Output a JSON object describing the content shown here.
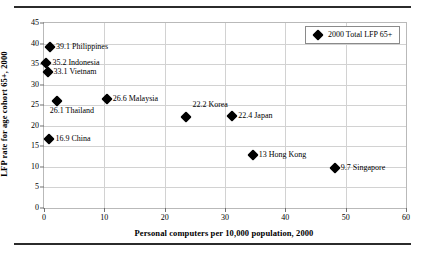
{
  "chart_data": {
    "type": "scatter",
    "title": "",
    "xlabel": "Personal  computers  per 10,000 population,  2000",
    "ylabel": "LFP rate for age cohort 65+, 2000",
    "xlim": [
      0,
      60
    ],
    "ylim": [
      0,
      45
    ],
    "xticks": [
      0,
      10,
      20,
      30,
      40,
      50,
      60
    ],
    "yticks": [
      0,
      5,
      10,
      15,
      20,
      25,
      30,
      35,
      40,
      45
    ],
    "grid": true,
    "legend": {
      "position": "top-right",
      "entries": [
        {
          "label": "2000 Total LFP 65+",
          "marker": "diamond",
          "color": "#000000"
        }
      ]
    },
    "series": [
      {
        "name": "2000 Total LFP 65+",
        "marker": "diamond",
        "color": "#000000",
        "points": [
          {
            "label": "39.1 Philippines",
            "country": "Philippines",
            "x": 1.0,
            "y": 39.1,
            "label_pos": "right"
          },
          {
            "label": "35.2 Indonesia",
            "country": "Indonesia",
            "x": 0.4,
            "y": 35.2,
            "label_pos": "right"
          },
          {
            "label": "33.1 Vietnam",
            "country": "Vietnam",
            "x": 0.6,
            "y": 33.1,
            "label_pos": "right"
          },
          {
            "label": "26.6 Malaysia",
            "country": "Malaysia",
            "x": 10.4,
            "y": 26.6,
            "label_pos": "right"
          },
          {
            "label": "26.1 Thailand",
            "country": "Thailand",
            "x": 2.1,
            "y": 26.1,
            "label_pos": "below-left"
          },
          {
            "label": "22.2 Korea",
            "country": "Korea",
            "x": 23.6,
            "y": 22.2,
            "label_pos": "above-left"
          },
          {
            "label": "22.4 Japan",
            "country": "Japan",
            "x": 31.2,
            "y": 22.4,
            "label_pos": "right"
          },
          {
            "label": "16.9 China",
            "country": "China",
            "x": 0.9,
            "y": 16.9,
            "label_pos": "right"
          },
          {
            "label": "13 Hong Kong",
            "country": "Hong Kong",
            "x": 34.6,
            "y": 13.0,
            "label_pos": "right"
          },
          {
            "label": "9.7 Singapore",
            "country": "Singapore",
            "x": 48.2,
            "y": 9.7,
            "label_pos": "right"
          }
        ]
      }
    ]
  }
}
